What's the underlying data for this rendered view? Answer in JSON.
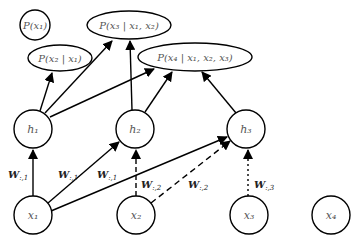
{
  "diagram": {
    "title": "",
    "output_nodes": [
      {
        "id": "p1",
        "label": "P(x1)",
        "text": "P(x₁)"
      },
      {
        "id": "p2",
        "label": "P(x2|x1)",
        "text": "P(x₂ | x₁)"
      },
      {
        "id": "p3",
        "label": "P(x3|x1,x2)",
        "text": "P(x₃ | x₁, x₂)"
      },
      {
        "id": "p4",
        "label": "P(x4|x1,x2,x3)",
        "text": "P(x₄ | x₁, x₂, x₃)"
      }
    ],
    "hidden_nodes": [
      {
        "id": "h1",
        "text": "h₁"
      },
      {
        "id": "h2",
        "text": "h₂"
      },
      {
        "id": "h3",
        "text": "h₃"
      }
    ],
    "input_nodes": [
      {
        "id": "x1",
        "text": "x₁"
      },
      {
        "id": "x2",
        "text": "x₂"
      },
      {
        "id": "x3",
        "text": "x₃"
      },
      {
        "id": "x4",
        "text": "x₄"
      }
    ],
    "edge_labels": {
      "x1_h1": "W:,1",
      "x1_h2": "W:,1",
      "x1_h3": "W:,1",
      "x2_h2": "W:,2",
      "x2_h3": "W:,2",
      "x3_h3": "W:,3"
    },
    "edge_label_display": {
      "w1": "W",
      "w1_sub": ":,1",
      "w2": "W",
      "w2_sub": ":,2",
      "w3": "W",
      "w3_sub": ":,3"
    },
    "edges": [
      {
        "from": "x1",
        "to": "h1",
        "style": "solid"
      },
      {
        "from": "x1",
        "to": "h2",
        "style": "solid"
      },
      {
        "from": "x1",
        "to": "h3",
        "style": "solid"
      },
      {
        "from": "x2",
        "to": "h2",
        "style": "dashed"
      },
      {
        "from": "x2",
        "to": "h3",
        "style": "dashed"
      },
      {
        "from": "x3",
        "to": "h3",
        "style": "dotted"
      },
      {
        "from": "h1",
        "to": "p2",
        "style": "solid"
      },
      {
        "from": "h1",
        "to": "p3",
        "style": "solid"
      },
      {
        "from": "h1",
        "to": "p4",
        "style": "solid"
      },
      {
        "from": "h2",
        "to": "p3",
        "style": "solid"
      },
      {
        "from": "h2",
        "to": "p4",
        "style": "solid"
      },
      {
        "from": "h3",
        "to": "p4",
        "style": "solid"
      }
    ]
  }
}
